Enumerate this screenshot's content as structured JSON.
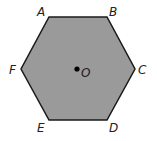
{
  "diagram": {
    "shape": "regular-hexagon",
    "fill_color": "#9a9a9a",
    "stroke_color": "#1a1a1a",
    "vertices": [
      {
        "label": "A",
        "x": 49,
        "y": 17
      },
      {
        "label": "B",
        "x": 107,
        "y": 17
      },
      {
        "label": "C",
        "x": 135,
        "y": 69
      },
      {
        "label": "D",
        "x": 107,
        "y": 120
      },
      {
        "label": "E",
        "x": 49,
        "y": 120
      },
      {
        "label": "F",
        "x": 21,
        "y": 69
      }
    ],
    "labels": {
      "A": "A",
      "B": "B",
      "C": "C",
      "D": "D",
      "E": "E",
      "F": "F",
      "O": "O"
    },
    "center": {
      "label": "O",
      "x": 77,
      "y": 69
    }
  }
}
